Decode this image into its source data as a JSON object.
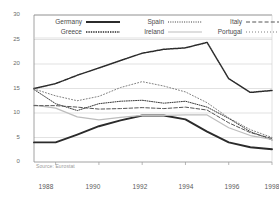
{
  "chart_data": {
    "type": "line",
    "title": "",
    "subtitle": "",
    "xlabel": "",
    "ylabel": "",
    "source_note": "Source: Eurostat",
    "grid": true,
    "legend_position": "top-inside",
    "xlim": [
      1987,
      1998
    ],
    "ylim": [
      0,
      30
    ],
    "yticks": [
      0,
      5,
      10,
      15,
      20,
      25,
      30
    ],
    "xticks": [
      1988,
      1990,
      1992,
      1994,
      1996,
      1998
    ],
    "xtick_labels": [
      "1988",
      "1990",
      "1992",
      "1994",
      "1996",
      "1998"
    ],
    "ytick_labels": [
      "0",
      "5",
      "10",
      "15",
      "20",
      "25",
      "30"
    ],
    "x": [
      1987,
      1988,
      1989,
      1990,
      1991,
      1992,
      1993,
      1994,
      1995,
      1996,
      1997,
      1998
    ],
    "series": [
      {
        "name": "Germany",
        "style": "solid-thick",
        "color": "#2b2b2b",
        "values": [
          4.0,
          4.0,
          5.6,
          7.3,
          8.5,
          9.5,
          9.5,
          8.7,
          6.2,
          4.0,
          3.0,
          2.6
        ]
      },
      {
        "name": "Greece",
        "style": "dotted-dark",
        "color": "#2b2b2b",
        "values": [
          15.0,
          16.0,
          17.7,
          19.2,
          20.7,
          22.2,
          23.0,
          23.3,
          24.4,
          17.0,
          14.2,
          14.6
        ]
      },
      {
        "name": "Spain",
        "style": "dotted-fine",
        "color": "#3a3a3a",
        "values": [
          14.8,
          11.9,
          10.5,
          11.9,
          12.4,
          12.6,
          12.0,
          12.4,
          11.2,
          8.9,
          6.2,
          4.5
        ]
      },
      {
        "name": "Ireland",
        "style": "solid-light",
        "color": "#bdbdbd",
        "values": [
          11.6,
          11.0,
          9.2,
          8.6,
          9.1,
          9.5,
          9.5,
          9.6,
          9.6,
          7.0,
          5.4,
          4.6
        ]
      },
      {
        "name": "Italy",
        "style": "dashed",
        "color": "#555555",
        "values": [
          11.5,
          11.5,
          11.2,
          10.8,
          10.9,
          11.1,
          10.9,
          11.2,
          10.6,
          8.0,
          6.0,
          4.8
        ]
      },
      {
        "name": "Portugal",
        "style": "dotted-sparse",
        "color": "#808080",
        "values": [
          14.9,
          13.5,
          12.5,
          13.4,
          15.2,
          16.4,
          15.5,
          14.3,
          12.1,
          9.0,
          6.6,
          5.0
        ]
      }
    ]
  },
  "legend": {
    "items": [
      {
        "label": "Germany",
        "icon": "line-solid-thick-icon"
      },
      {
        "label": "Spain",
        "icon": "line-dotted-fine-icon"
      },
      {
        "label": "Italy",
        "icon": "line-dashed-icon"
      },
      {
        "label": "Greece",
        "icon": "line-dotted-dark-icon"
      },
      {
        "label": "Ireland",
        "icon": "line-solid-light-icon"
      },
      {
        "label": "Portugal",
        "icon": "line-dotted-sparse-icon"
      }
    ]
  },
  "footer": {
    "source": "Source: Eurostat"
  }
}
